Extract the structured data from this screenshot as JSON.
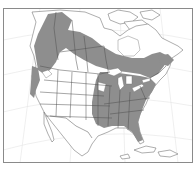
{
  "map": {
    "type": "species-range-map",
    "region": "North America",
    "colors": {
      "background": "#ffffff",
      "range_fill": "#8e8e8e",
      "borders": "#4e4e4e",
      "graticule": "#e4e4e4",
      "frame": "#8a8a8a"
    },
    "range_regions": [
      "Alaska / Yukon / northern British Columbia",
      "Pacific Northwest coast",
      "Boreal Canada band",
      "Eastern United States",
      "Maritime provinces"
    ]
  }
}
